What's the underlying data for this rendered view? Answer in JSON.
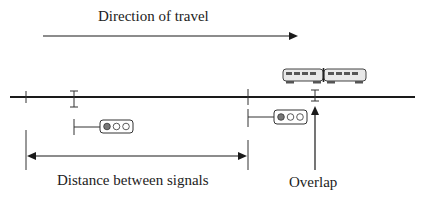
{
  "diagram": {
    "labels": {
      "direction": "Direction of travel",
      "distance": "Distance between signals",
      "overlap": "Overlap"
    },
    "signals": [
      {
        "name": "signal-1",
        "lamps": [
          "red",
          "off",
          "off"
        ]
      },
      {
        "name": "signal-2",
        "lamps": [
          "red",
          "off",
          "off"
        ]
      }
    ],
    "colors": {
      "line": "#1a1a1a",
      "lamp_on": "#777777",
      "lamp_off": "#ffffff"
    }
  }
}
